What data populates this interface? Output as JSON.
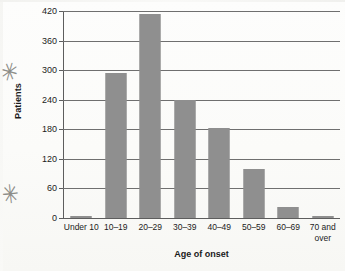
{
  "chart_data": {
    "type": "bar",
    "title": "",
    "xlabel": "Age of onset",
    "ylabel": "Patients",
    "categories": [
      "Under 10",
      "10–19",
      "20–29",
      "30–39",
      "40–49",
      "50–59",
      "60–69",
      "70 and over"
    ],
    "values": [
      5,
      295,
      413,
      239,
      183,
      100,
      22,
      5
    ],
    "ylim": [
      0,
      420
    ],
    "yticks": [
      0,
      60,
      120,
      180,
      240,
      300,
      360,
      420
    ],
    "ytick_labels": [
      "0",
      "60",
      "120",
      "180",
      "240",
      "300",
      "360",
      "420"
    ],
    "grid": "horizontal",
    "legend": "none",
    "bar_color": "#8f8f8f",
    "axis_color": "#5d5d5d",
    "gridline_color": "#6f6f6f",
    "background_color": "#fdfdfb"
  },
  "annotations": {
    "margin_mark_upper": "✳",
    "margin_mark_lower": "✳"
  }
}
